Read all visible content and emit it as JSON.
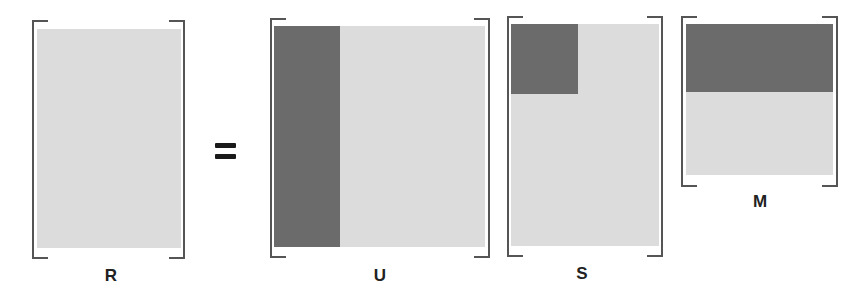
{
  "diagram": {
    "title": "",
    "equation": "R = U S M",
    "operator": "=",
    "matrices": [
      {
        "id": "R",
        "label": "R"
      },
      {
        "id": "U",
        "label": "U"
      },
      {
        "id": "S",
        "label": "S"
      },
      {
        "id": "M",
        "label": "M"
      }
    ],
    "colors": {
      "light_fill": "#dcdcdc",
      "dark_fill": "#6b6b6b",
      "bracket": "#555555",
      "text": "#222222"
    }
  }
}
